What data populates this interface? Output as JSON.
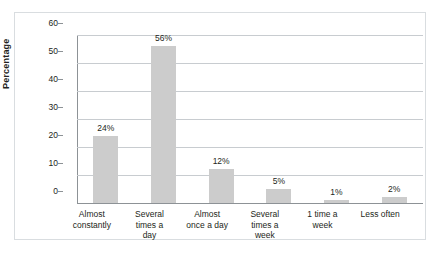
{
  "chart_data": {
    "type": "bar",
    "title": "",
    "xlabel": "",
    "ylabel": "Percentage",
    "ylim": [
      0,
      60
    ],
    "ytick_values": [
      0,
      10,
      20,
      30,
      40,
      50,
      60
    ],
    "ytick_labels": [
      "0",
      "10",
      "20",
      "30",
      "40",
      "50",
      "60"
    ],
    "grid": true,
    "legend": "none",
    "bar_color": "#cccccc",
    "categories": [
      "Almost\nconstantly",
      "Several\ntimes a\nday",
      "Almost\nonce a day",
      "Several\ntimes a\nweek",
      "1 time a\nweek",
      "Less often"
    ],
    "values": [
      24,
      56,
      12,
      5,
      1,
      2
    ],
    "value_labels": [
      "24%",
      "56%",
      "12%",
      "5%",
      "1%",
      "2%"
    ]
  },
  "colors": {
    "bar": "#cccccc",
    "gridline": "#c8ccd0",
    "axis": "#8d9296",
    "frame": "#d9dde0",
    "text": "#231f20",
    "background": "#ffffff"
  }
}
